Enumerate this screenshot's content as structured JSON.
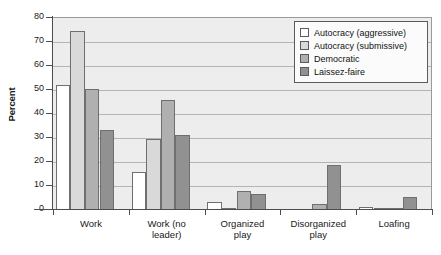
{
  "chart_data": {
    "type": "bar",
    "title": "",
    "xlabel": "",
    "ylabel": "Percent",
    "ylim": [
      0,
      80
    ],
    "yticks": [
      0,
      10,
      20,
      30,
      40,
      50,
      60,
      70,
      80
    ],
    "ytick_labels": [
      "0",
      "10",
      "20",
      "30",
      "40",
      "50",
      "60",
      "70",
      "80"
    ],
    "grid": true,
    "legend_position": "top-right",
    "categories": [
      "Work",
      "Work (no leader)",
      "Organized play",
      "Disorganized play",
      "Loafing"
    ],
    "category_lines": [
      [
        "Work"
      ],
      [
        "Work (no",
        "leader)"
      ],
      [
        "Organized",
        "play"
      ],
      [
        "Disorganized",
        "play"
      ],
      [
        "Loafing"
      ]
    ],
    "series": [
      {
        "name": "Autocracy (aggressive)",
        "color": "#ffffff",
        "values": [
          51.5,
          15.5,
          3.0,
          0.0,
          0.7
        ]
      },
      {
        "name": "Autocracy (submissive)",
        "color": "#d9d9d9",
        "values": [
          74.0,
          29.0,
          0.6,
          0.0,
          0.2
        ]
      },
      {
        "name": "Democratic",
        "color": "#b0b0b0",
        "values": [
          50.0,
          45.5,
          7.5,
          2.0,
          0.2
        ]
      },
      {
        "name": "Laissez-faire",
        "color": "#919191",
        "values": [
          33.0,
          31.0,
          6.4,
          18.2,
          4.8
        ]
      }
    ]
  },
  "style": {
    "plot_background": "#ededed",
    "gridline_color": "#b4b4b4",
    "axis_color": "#4d4d4d",
    "bar_border": "#6f6f6f",
    "legend_background": "#fbfbfb",
    "legend_border": "#5b5b5b"
  }
}
